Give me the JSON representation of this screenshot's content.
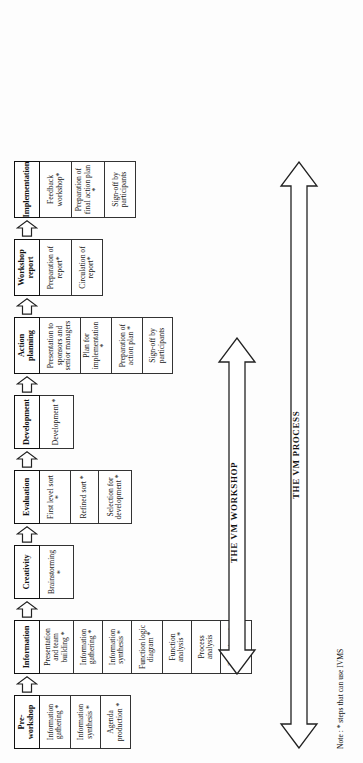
{
  "diagram": {
    "note": "Note : * steps that can use IVMS",
    "stages": [
      {
        "id": "pre-workshop",
        "label": "Pre-workshop",
        "tasks": [
          "Information gathering *",
          "Information synthesis *",
          "Agenda production *"
        ]
      },
      {
        "id": "information",
        "label": "Information",
        "tasks": [
          "Presentation and team building *",
          "Information gathering *",
          "Information synthesis *",
          "Function logic diagram *",
          "Function analysis *",
          "Process analysis",
          "Targeting of functions"
        ]
      },
      {
        "id": "creativity",
        "label": "Creativity",
        "tasks": [
          "Brainstorming *"
        ]
      },
      {
        "id": "evaluation",
        "label": "Evaluation",
        "tasks": [
          "First level sort *",
          "Refined sort *",
          "Selection for development *"
        ]
      },
      {
        "id": "development",
        "label": "Development",
        "tasks": [
          "Development *"
        ]
      },
      {
        "id": "action-planning",
        "label": "Action planning",
        "tasks": [
          "Presentation to sponsors and senior managers",
          "Plan for implementation *",
          "Preparation of action plan *",
          "Sign-off by participants"
        ]
      },
      {
        "id": "workshop-report",
        "label": "Workshop report",
        "tasks": [
          "Preparation of report*",
          "Circulation of report*"
        ]
      },
      {
        "id": "implementation",
        "label": "Implementation",
        "tasks": [
          "Feedback workshop*",
          "Preparation of final action plan *",
          "Sign-off by participants"
        ]
      }
    ],
    "span_arrows": [
      {
        "id": "vm-workshop",
        "label": "THE VM WORKSHOP"
      },
      {
        "id": "vm-process",
        "label": "THE VM PROCESS"
      }
    ],
    "colors": {
      "ink": "#111111",
      "rule": "#333333",
      "page": "#ffffff"
    }
  }
}
